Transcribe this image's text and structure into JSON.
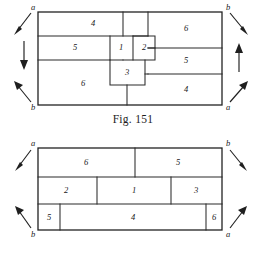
{
  "page": {
    "background_color": "#ffffff",
    "ink_color": "#222222"
  },
  "figures": [
    {
      "id": "fig-151",
      "caption": "Fig. 151",
      "pieces": [
        {
          "label": "4",
          "name": "piece-4-top-left"
        },
        {
          "label": "6",
          "name": "piece-6-top-right"
        },
        {
          "label": "5",
          "name": "piece-5-left"
        },
        {
          "label": "1",
          "name": "piece-1-center"
        },
        {
          "label": "2",
          "name": "piece-2-center"
        },
        {
          "label": "5",
          "name": "piece-5-right"
        },
        {
          "label": "3",
          "name": "piece-3-center"
        },
        {
          "label": "6",
          "name": "piece-6-bottom-left"
        },
        {
          "label": "4",
          "name": "piece-4-bottom-right"
        }
      ],
      "corner_labels": [
        {
          "label": "a",
          "name": "corner-label-a-top-left"
        },
        {
          "label": "b",
          "name": "corner-label-b-top-right"
        },
        {
          "label": "b",
          "name": "corner-label-b-bottom-left"
        },
        {
          "label": "a",
          "name": "corner-label-a-bottom-right"
        }
      ],
      "arrows": [
        {
          "name": "arrow-top-left-outward",
          "direction": "down-left"
        },
        {
          "name": "arrow-top-right-outward",
          "direction": "down-right"
        },
        {
          "name": "arrow-left-down",
          "direction": "down"
        },
        {
          "name": "arrow-right-up",
          "direction": "up"
        },
        {
          "name": "arrow-bottom-left-outward",
          "direction": "up-left"
        },
        {
          "name": "arrow-bottom-right-outward",
          "direction": "up-right"
        }
      ]
    },
    {
      "id": "fig-152",
      "caption": "Fig. 152",
      "pieces": [
        {
          "label": "6",
          "name": "piece-6-top-left"
        },
        {
          "label": "5",
          "name": "piece-5-top-right"
        },
        {
          "label": "2",
          "name": "piece-2-middle-left"
        },
        {
          "label": "1",
          "name": "piece-1-middle-center"
        },
        {
          "label": "3",
          "name": "piece-3-middle-right"
        },
        {
          "label": "5",
          "name": "piece-5-bottom-left"
        },
        {
          "label": "4",
          "name": "piece-4-bottom-center"
        },
        {
          "label": "6",
          "name": "piece-6-bottom-right"
        }
      ],
      "corner_labels": [
        {
          "label": "a",
          "name": "corner-label-a-top-left"
        },
        {
          "label": "b",
          "name": "corner-label-b-top-right"
        },
        {
          "label": "b",
          "name": "corner-label-b-bottom-left"
        },
        {
          "label": "a",
          "name": "corner-label-a-bottom-right"
        }
      ],
      "arrows": [
        {
          "name": "arrow-top-left-outward",
          "direction": "down-left"
        },
        {
          "name": "arrow-top-right-outward",
          "direction": "down-right"
        },
        {
          "name": "arrow-bottom-left-outward",
          "direction": "up-left"
        },
        {
          "name": "arrow-bottom-right-outward",
          "direction": "up-right"
        }
      ]
    }
  ]
}
